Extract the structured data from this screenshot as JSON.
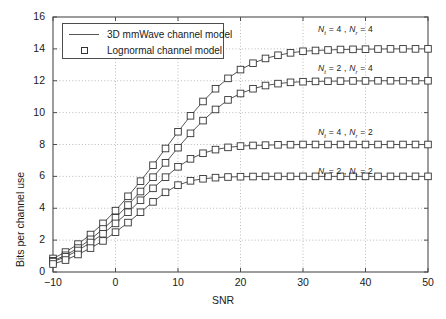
{
  "chart_data": {
    "type": "line",
    "title": "",
    "xlabel": "SNR",
    "ylabel": "Bits per channel use",
    "xlim": [
      -10,
      50
    ],
    "ylim": [
      0,
      16
    ],
    "xticks": [
      -10,
      0,
      10,
      20,
      30,
      40,
      50
    ],
    "yticks": [
      0,
      2,
      4,
      6,
      8,
      10,
      12,
      14,
      16
    ],
    "grid": true,
    "grid_style": "dotted",
    "legend_position": "top-left",
    "legend": [
      {
        "label": "3D mmWave channel model",
        "style": "line"
      },
      {
        "label": "Lognormal channel model",
        "style": "marker-square"
      }
    ],
    "x": [
      -10,
      -8,
      -6,
      -4,
      -2,
      0,
      2,
      4,
      6,
      8,
      10,
      12,
      14,
      16,
      18,
      20,
      22,
      24,
      26,
      28,
      30,
      32,
      34,
      36,
      38,
      40,
      42,
      44,
      46,
      48,
      50
    ],
    "series": [
      {
        "name": "Nt = 4 , Nr = 4",
        "annotation": "N_t = 4 , N_r = 4",
        "saturation": 14,
        "values": [
          0.85,
          1.25,
          1.75,
          2.35,
          3.05,
          3.85,
          4.75,
          5.7,
          6.7,
          7.75,
          8.8,
          9.8,
          10.7,
          11.5,
          12.15,
          12.7,
          13.1,
          13.4,
          13.6,
          13.75,
          13.85,
          13.9,
          13.93,
          13.96,
          13.97,
          13.98,
          13.99,
          14.0,
          14.0,
          14.0,
          14.0
        ]
      },
      {
        "name": "Nt = 2 , Nr = 4",
        "annotation": "N_t = 2 , N_r = 4",
        "saturation": 12,
        "values": [
          0.7,
          1.05,
          1.5,
          2.05,
          2.7,
          3.4,
          4.2,
          5.05,
          5.95,
          6.85,
          7.8,
          8.7,
          9.5,
          10.2,
          10.8,
          11.2,
          11.5,
          11.7,
          11.82,
          11.9,
          11.94,
          11.96,
          11.97,
          11.98,
          11.99,
          11.99,
          12.0,
          12.0,
          12.0,
          12.0,
          12.0
        ]
      },
      {
        "name": "Nt = 4 , Nr = 2",
        "annotation": "N_t = 4 , N_r = 2",
        "saturation": 8,
        "values": [
          0.65,
          0.95,
          1.35,
          1.85,
          2.4,
          3.05,
          3.75,
          4.5,
          5.25,
          5.95,
          6.6,
          7.1,
          7.45,
          7.68,
          7.82,
          7.9,
          7.94,
          7.96,
          7.98,
          7.99,
          8.0,
          8.0,
          8.0,
          8.0,
          8.0,
          8.0,
          8.0,
          8.0,
          8.0,
          8.0,
          8.0
        ]
      },
      {
        "name": "Nt = 2 , Nr = 2",
        "annotation": "N_t = 2 , N_r = 2",
        "saturation": 6,
        "values": [
          0.5,
          0.75,
          1.1,
          1.5,
          1.95,
          2.5,
          3.1,
          3.75,
          4.4,
          5.0,
          5.45,
          5.72,
          5.85,
          5.92,
          5.96,
          5.98,
          5.99,
          6.0,
          6.0,
          6.0,
          6.0,
          6.0,
          6.0,
          6.0,
          6.0,
          6.0,
          6.0,
          6.0,
          6.0,
          6.0,
          6.0
        ]
      }
    ],
    "colors": {
      "line": "#555555",
      "marker_edge": "#333333",
      "marker_face": "#ffffff",
      "axis": "#4d4d4d",
      "grid": "#aaaaaa",
      "text": "#1a1a1a"
    }
  },
  "annotations": [
    {
      "text_parts": {
        "nt": "N",
        "t": "t",
        "eq1": " = 4 , ",
        "nr": "N",
        "r": "r",
        "eq2": " = 4"
      },
      "full": "N t = 4 , N r = 4"
    },
    {
      "full": "N t = 2 , N r = 4"
    },
    {
      "full": "N t = 4 , N r = 2"
    },
    {
      "full": "N t = 2 , N r = 2"
    }
  ]
}
